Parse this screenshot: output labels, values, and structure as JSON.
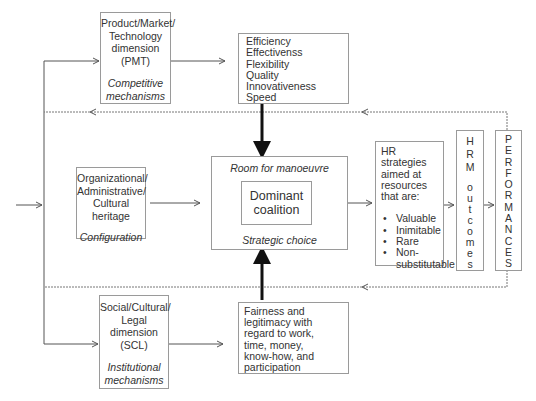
{
  "diagram": {
    "type": "flow-diagram",
    "colors": {
      "line": "#555555",
      "border": "#9a9a9a",
      "text": "#333333",
      "thick_arrow": "#111111"
    }
  },
  "pmt": {
    "title_lines": [
      "Product/Market/",
      "Technology",
      "dimension",
      "(PMT)"
    ],
    "subtitle_lines": [
      "Competitive",
      "mechanisms"
    ]
  },
  "outcomes_top": {
    "items": [
      "Efficiency",
      "Effectivenss",
      "Flexibility",
      "Quality",
      "Innovativeness",
      "Speed"
    ]
  },
  "org": {
    "title_lines": [
      "Organizational/",
      "Administrative/",
      "Cultural",
      "heritage"
    ],
    "subtitle": "Configuration"
  },
  "center": {
    "top_label": "Room for manoeuvre",
    "inner_lines": [
      "Dominant",
      "coalition"
    ],
    "bottom_label": "Strategic choice"
  },
  "hr_strategies": {
    "intro_lines": [
      "HR strategies",
      "aimed at",
      "resources",
      "that are:"
    ],
    "bullets": [
      "Valuable",
      "Inimitable",
      "Rare",
      "Non-substitutable"
    ]
  },
  "hrm_outcomes": {
    "letters": [
      "H",
      "R",
      "M",
      "",
      "o",
      "u",
      "t",
      "c",
      "o",
      "m",
      "e",
      "s"
    ]
  },
  "performances": {
    "letters": [
      "P",
      "E",
      "R",
      "F",
      "O",
      "R",
      "M",
      "A",
      "N",
      "C",
      "E",
      "S"
    ]
  },
  "scl": {
    "title_lines": [
      "Social/Cultural/",
      "Legal",
      "dimension",
      "(SCL)"
    ],
    "subtitle_lines": [
      "Institutional",
      "mechanisms"
    ]
  },
  "outcomes_bottom": {
    "lines": [
      "Fairness and",
      "legitimacy with",
      "regard to work,",
      "time, money,",
      "know-how, and",
      "participation"
    ]
  }
}
